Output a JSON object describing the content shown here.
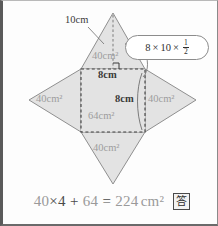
{
  "figure": {
    "fill_color": "#e2e2e2",
    "stroke_color": "#8f8f8f",
    "dash_color": "#4a4a4a",
    "label_grey": "#9d9d9d",
    "label_dark": "#3a3a3a"
  },
  "labels": {
    "slant_height": "10cm",
    "top_face_area": "40cm²",
    "left_face_area": "40cm²",
    "right_face_area": "40cm²",
    "bottom_face_area": "40cm²",
    "base_area": "64cm²",
    "base_width": "8cm",
    "base_side": "8cm"
  },
  "callout": {
    "factor_a": "8",
    "times_1": "×",
    "factor_b": "10",
    "times_2": "×",
    "frac_num": "1",
    "frac_den": "2"
  },
  "equation": {
    "part_1": "40",
    "mult": "×",
    "part_2": "4",
    "plus": "+",
    "part_3": "64",
    "equals": "=",
    "result": "224",
    "unit": "cm²"
  },
  "answer_badge": {
    "glyph": "答"
  }
}
